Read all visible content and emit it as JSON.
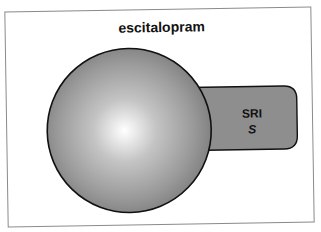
{
  "title": "escitalopram",
  "tab": {
    "label": "SRI",
    "sublabel": "S"
  },
  "colors": {
    "frame_border": "#8a8a8a",
    "sphere_center": "#ffffff",
    "sphere_edge": "#7c7c7c",
    "sphere_stroke": "#111111",
    "tab_fill": "#8e8e8e",
    "text": "#111111"
  }
}
